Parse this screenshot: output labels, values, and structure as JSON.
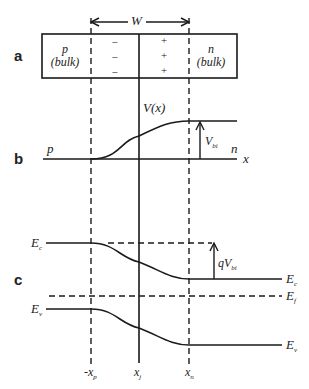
{
  "panels": {
    "a": {
      "label": "a",
      "width_label": "W",
      "p_region": {
        "line1": "p",
        "line2": "(bulk)"
      },
      "n_region": {
        "line1": "n",
        "line2": "(bulk)"
      },
      "neg_charges": [
        "−",
        "−",
        "−"
      ],
      "pos_charges": [
        "+",
        "+",
        "+"
      ]
    },
    "b": {
      "label": "b",
      "potential_label": "V(x)",
      "p_label": "p",
      "n_label": "n",
      "x_axis_label": "x",
      "vbi_label": "V",
      "vbi_sub": "bi"
    },
    "c": {
      "label": "c",
      "ec_left": "E",
      "ec_left_sub": "c",
      "ev_left": "E",
      "ev_left_sub": "v",
      "ec_right": "E",
      "ec_right_sub": "c",
      "ef_right": "E",
      "ef_right_sub": "f",
      "ev_right": "E",
      "ev_right_sub": "v",
      "qvbi_label": "qV",
      "qvbi_sub": "bi"
    }
  },
  "axis_labels": {
    "xp": "-x",
    "xp_sub": "p",
    "xj": "x",
    "xj_sub": "j",
    "xn": "x",
    "xn_sub": "n"
  }
}
